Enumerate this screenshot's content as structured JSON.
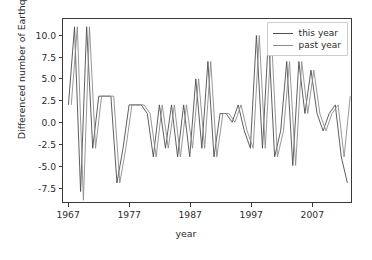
{
  "chart_data": {
    "type": "line",
    "title": "",
    "xlabel": "year",
    "ylabel": "Differenced number of Earthquakes",
    "xlim": [
      1966.0,
      2013.5
    ],
    "ylim": [
      -9.2,
      11.9
    ],
    "xticks": [
      1967,
      1977,
      1987,
      1997,
      2007
    ],
    "xtick_labels": [
      "1967",
      "1977",
      "1987",
      "1997",
      "2007"
    ],
    "yticks": [
      -7.5,
      -5.0,
      -2.5,
      0.0,
      2.5,
      5.0,
      7.5,
      10.0
    ],
    "ytick_labels": [
      "-7.5",
      "-5.0",
      "-2.5",
      "0.0",
      "2.5",
      "5.0",
      "7.5",
      "10.0"
    ],
    "grid": false,
    "legend_position": "upper right",
    "colors": {
      "this_year": "#4d4d4d",
      "past_year": "#8c8c8c",
      "axes": "#3a3a3a",
      "text": "#2b2b2b",
      "background": "#ffffff"
    },
    "x": [
      1967,
      1968,
      1969,
      1970,
      1971,
      1972,
      1973,
      1974,
      1975,
      1976,
      1977,
      1978,
      1979,
      1980,
      1981,
      1982,
      1983,
      1984,
      1985,
      1986,
      1987,
      1988,
      1989,
      1990,
      1991,
      1992,
      1993,
      1994,
      1995,
      1996,
      1997,
      1998,
      1999,
      2000,
      2001,
      2002,
      2003,
      2004,
      2005,
      2006,
      2007,
      2008,
      2009,
      2010,
      2011,
      2012,
      2013
    ],
    "series": [
      {
        "name": "this year",
        "color": "#4d4d4d",
        "values": [
          2,
          11,
          -8,
          11,
          -3,
          3,
          3,
          3,
          -7,
          -3,
          2,
          2,
          2,
          1,
          -4,
          2,
          -3,
          2,
          -4,
          2,
          -4,
          5,
          -3,
          7,
          -4,
          1,
          1,
          0,
          2,
          -1,
          -3,
          10,
          -3,
          10,
          -4,
          -1,
          7,
          -5,
          7,
          1,
          6,
          1,
          -1,
          1,
          2,
          -4,
          -7
        ]
      },
      {
        "name": "past year",
        "color": "#8c8c8c",
        "values": [
          2,
          11,
          -9,
          11,
          -3,
          3,
          3,
          3,
          -7,
          -3,
          2,
          2,
          2,
          1,
          -4,
          2,
          -3,
          2,
          -4,
          2,
          -3,
          5,
          -3,
          7,
          -4,
          1,
          1,
          0,
          2,
          -1,
          -3,
          10,
          -3,
          10,
          -4,
          -1,
          7,
          -5,
          7,
          1,
          6,
          1,
          -1,
          1,
          2,
          -4,
          3
        ]
      }
    ],
    "points": {
      "this year": [
        [
          1967.0,
          2
        ],
        [
          1967.55,
          11
        ],
        [
          1968.1,
          -8
        ],
        [
          1968.7,
          11
        ],
        [
          1969.3,
          -8
        ],
        [
          1969.9,
          3
        ],
        [
          1971.0,
          3
        ],
        [
          1971.6,
          -4
        ],
        [
          1972.2,
          3
        ],
        [
          1972.8,
          -7
        ],
        [
          1973.4,
          3
        ],
        [
          1974.0,
          -8
        ],
        [
          1974.6,
          2
        ],
        [
          1975.4,
          2
        ],
        [
          1976.0,
          -4
        ],
        [
          1976.6,
          2
        ],
        [
          1977.2,
          -3
        ],
        [
          1977.8,
          2
        ],
        [
          1978.4,
          -4
        ],
        [
          1979.0,
          2
        ],
        [
          1979.6,
          -3
        ],
        [
          1980.2,
          5
        ],
        [
          1980.8,
          -3
        ],
        [
          1981.4,
          7
        ],
        [
          1982.0,
          -4
        ],
        [
          1982.6,
          1
        ],
        [
          1983.2,
          1
        ],
        [
          1983.8,
          0
        ],
        [
          1984.4,
          2
        ],
        [
          1985.0,
          -1
        ],
        [
          1985.6,
          -3
        ],
        [
          1986.2,
          10
        ],
        [
          1986.8,
          -3
        ],
        [
          1987.4,
          10
        ],
        [
          1988.0,
          -4
        ],
        [
          1988.6,
          -1
        ],
        [
          1989.2,
          7
        ],
        [
          1989.8,
          -5
        ],
        [
          1990.4,
          7
        ],
        [
          1991.0,
          1
        ],
        [
          1992.0,
          6
        ],
        [
          1992.6,
          1
        ],
        [
          1993.2,
          -1
        ],
        [
          1993.8,
          1
        ],
        [
          1994.4,
          2
        ],
        [
          1995.0,
          -4
        ],
        [
          1996.0,
          -7
        ]
      ]
    }
  },
  "legend": {
    "items": [
      {
        "label": "this year",
        "color": "#4d4d4d"
      },
      {
        "label": "past year",
        "color": "#8c8c8c"
      }
    ]
  }
}
